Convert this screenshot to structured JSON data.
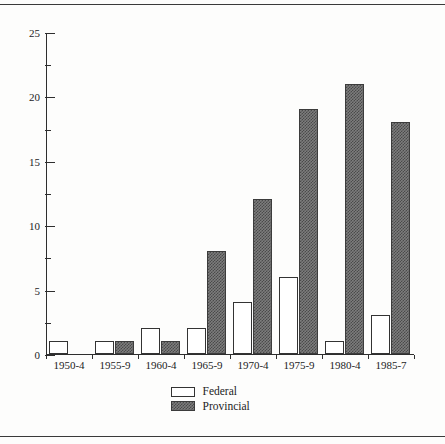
{
  "chart_data": {
    "type": "bar",
    "title": "",
    "subtitle": "",
    "xlabel": "",
    "ylabel": "",
    "categories": [
      "1950-4",
      "1955-9",
      "1960-4",
      "1965-9",
      "1970-4",
      "1975-9",
      "1980-4",
      "1985-7"
    ],
    "series": [
      {
        "name": "Federal",
        "values": [
          1,
          1,
          2,
          2,
          4,
          6,
          1,
          3
        ]
      },
      {
        "name": "Provincial",
        "values": [
          0,
          1,
          1,
          8,
          12,
          19,
          21,
          18
        ]
      }
    ],
    "ylim": [
      0,
      25
    ],
    "y_major_ticks": [
      0,
      5,
      10,
      15,
      20,
      25
    ],
    "y_tick_labels": [
      "0",
      "5",
      "10",
      "15",
      "20",
      "25"
    ],
    "y_minor_ticks": [
      2.5,
      7.5,
      12.5,
      17.5,
      22.5
    ],
    "grid": false,
    "legend_position": "bottom-center",
    "legend": [
      {
        "label": "Federal",
        "swatch": "white-outlined"
      },
      {
        "label": "Provincial",
        "swatch": "dark-hatched"
      }
    ],
    "colors": {
      "federal_fill": "#ffffff",
      "federal_stroke": "#333333",
      "provincial_fill": "#7d7d7d",
      "provincial_hatch": "#4a4a4a",
      "axis": "#2e2e2e",
      "text": "#1c1c1c",
      "background": "#fdfdfc",
      "rule": "#3a3a3a"
    }
  }
}
